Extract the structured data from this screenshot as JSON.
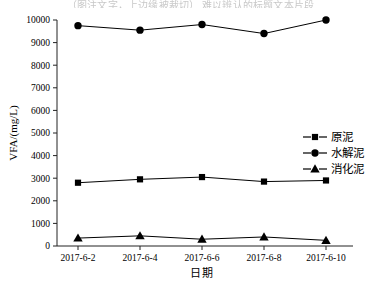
{
  "figure": {
    "top_caption": "（图注文字，上边缘被裁切） 难以辨认的标题文本片段",
    "background_color": "#ffffff",
    "series_color": "#000000"
  },
  "chart_data": {
    "type": "line",
    "title": "",
    "xlabel": "日期",
    "ylabel": "VFA/(mg/L)",
    "categories": [
      "2017-6-2",
      "2017-6-4",
      "2017-6-6",
      "2017-6-8",
      "2017-6-10"
    ],
    "ylim": [
      0,
      10000
    ],
    "ytick_step": 1000,
    "yticks": [
      0,
      1000,
      2000,
      3000,
      4000,
      5000,
      6000,
      7000,
      8000,
      9000,
      10000
    ],
    "ytick_labels": [
      "0",
      "1000",
      "2000",
      "3000",
      "4000",
      "5000",
      "6000",
      "7000",
      "8000",
      "9000",
      "10000"
    ],
    "grid": false,
    "legend_position": "right-middle",
    "series": [
      {
        "name": "原泥",
        "marker": "square",
        "color": "#000000",
        "values": [
          2800,
          2950,
          3050,
          2850,
          2900
        ]
      },
      {
        "name": "水解泥",
        "marker": "circle",
        "color": "#000000",
        "values": [
          9750,
          9550,
          9800,
          9400,
          10000
        ]
      },
      {
        "name": "消化泥",
        "marker": "triangle",
        "color": "#000000",
        "values": [
          350,
          450,
          300,
          400,
          250
        ]
      }
    ]
  },
  "legend": {
    "items": [
      {
        "label": "原泥",
        "marker": "square"
      },
      {
        "label": "水解泥",
        "marker": "circle"
      },
      {
        "label": "消化泥",
        "marker": "triangle"
      }
    ]
  }
}
